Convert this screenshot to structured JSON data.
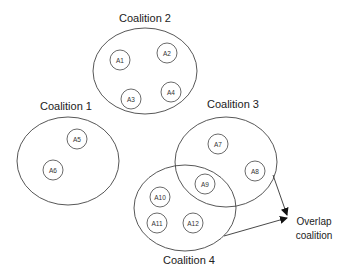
{
  "diagram": {
    "coalitions": [
      {
        "label": "Coalition 1",
        "agents": [
          "A5",
          "A6"
        ]
      },
      {
        "label": "Coalition 2",
        "agents": [
          "A1",
          "A2",
          "A3",
          "A4"
        ]
      },
      {
        "label": "Coalition 3",
        "agents": [
          "A7",
          "A8",
          "A9"
        ]
      },
      {
        "label": "Coalition 4",
        "agents": [
          "A9",
          "A10",
          "A11",
          "A12"
        ]
      }
    ],
    "agents": {
      "A1": "A1",
      "A2": "A2",
      "A3": "A3",
      "A4": "A4",
      "A5": "A5",
      "A6": "A6",
      "A7": "A7",
      "A8": "A8",
      "A9": "A9",
      "A10": "A10",
      "A11": "A11",
      "A12": "A12"
    },
    "annotation": {
      "line1": "Overlap",
      "line2": "coalition"
    }
  }
}
